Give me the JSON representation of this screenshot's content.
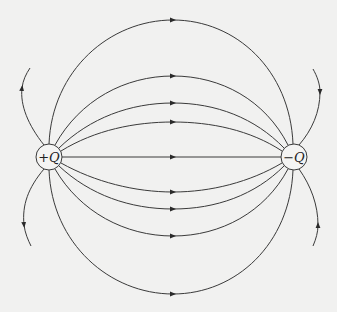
{
  "diagram": {
    "type": "electric-dipole-field-lines",
    "background_color": "#f1f1f0",
    "line_color": "#3a3a3a",
    "charges": [
      {
        "id": "positive",
        "sign": "+",
        "symbol": "Q",
        "label": "+Q",
        "cx": 49,
        "cy": 157,
        "r": 13
      },
      {
        "id": "negative",
        "sign": "−",
        "symbol": "Q",
        "label": "−Q",
        "cx": 294,
        "cy": 157,
        "r": 13
      }
    ],
    "field_lines": [
      {
        "name": "axis-line",
        "arrow": [
          173,
          157
        ]
      },
      {
        "name": "upper-line-1",
        "arrow": [
          173,
          122
        ]
      },
      {
        "name": "upper-line-2",
        "arrow": [
          173,
          103
        ]
      },
      {
        "name": "upper-line-3",
        "arrow": [
          173,
          76
        ]
      },
      {
        "name": "upper-outer-arc",
        "arrow": [
          173,
          20
        ]
      },
      {
        "name": "lower-line-1",
        "arrow": [
          173,
          192
        ]
      },
      {
        "name": "lower-line-2",
        "arrow": [
          173,
          209
        ]
      },
      {
        "name": "lower-line-3",
        "arrow": [
          173,
          236
        ]
      },
      {
        "name": "lower-outer-arc",
        "arrow": [
          173,
          294
        ]
      },
      {
        "name": "left-escape-up",
        "arrow": [
          22,
          88
        ],
        "direction": "outward"
      },
      {
        "name": "left-escape-down",
        "arrow": [
          24,
          225
        ],
        "direction": "outward"
      },
      {
        "name": "right-escape-up",
        "arrow": [
          319,
          92
        ],
        "direction": "inward"
      },
      {
        "name": "right-escape-down",
        "arrow": [
          318,
          225
        ],
        "direction": "inward"
      }
    ]
  }
}
